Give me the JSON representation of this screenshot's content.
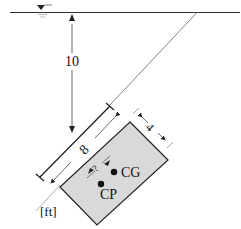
{
  "diagram": {
    "type": "hydrostatics-inclined-plate",
    "units_label": "[ft]",
    "depth_label": "10",
    "length_label": "8",
    "width_label": "4",
    "offset_label": "?",
    "cg_label": "CG",
    "cp_label": "CP",
    "free_surface_symbol": "water-surface-triangle",
    "colors": {
      "plate_fill": "#d9d9d9",
      "line": "#222222",
      "background": "#ffffff"
    }
  }
}
